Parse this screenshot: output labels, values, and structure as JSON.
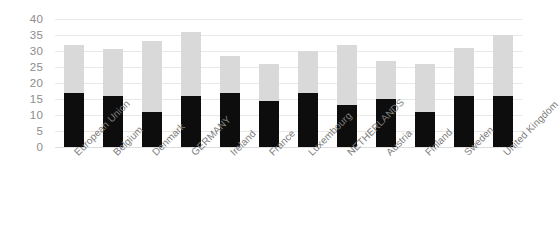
{
  "chart_data": {
    "type": "bar",
    "subtype": "stacked-column",
    "title": "",
    "subtitle": "",
    "xlabel": "",
    "ylabel": "",
    "ylim": [
      0,
      40
    ],
    "ytick_step": 5,
    "yticks": [
      40,
      35,
      30,
      25,
      20,
      15,
      10,
      5,
      0
    ],
    "grid": true,
    "legend": false,
    "legend_position": "none",
    "categories": [
      "European Union",
      "Belgium",
      "Denmark",
      "GERMANY",
      "Ireland",
      "France",
      "Luxembourg",
      "NETHERLANDS",
      "Austria",
      "Finland",
      "Sweden",
      "United Kingdom"
    ],
    "series": [
      {
        "name": "lower-segment",
        "color": "#0d0d0d",
        "values": [
          17,
          16,
          11,
          16,
          17,
          14.5,
          17,
          13,
          15,
          11,
          16,
          16
        ]
      },
      {
        "name": "upper-segment",
        "color": "#d9d9d9",
        "values": [
          15,
          14.5,
          22,
          20,
          11.5,
          11.5,
          13,
          19,
          12,
          15,
          15,
          19
        ]
      }
    ],
    "totals": [
      32,
      30.5,
      33,
      36,
      28.5,
      26,
      30,
      32,
      27,
      26,
      31,
      35
    ]
  },
  "axis": {
    "y_tick_labels": [
      "40",
      "35",
      "30",
      "25",
      "20",
      "15",
      "10",
      "5",
      "0"
    ]
  }
}
